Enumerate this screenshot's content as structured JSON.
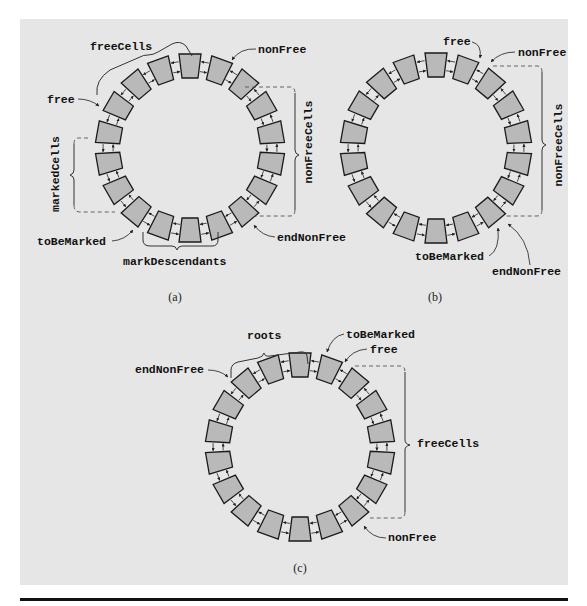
{
  "figure": {
    "colors": {
      "panel_background": "#e6e6e6",
      "cell_fill": "#b9b9b9",
      "cell_stroke": "#1a1a1a",
      "rule": "#111111"
    },
    "panel": {
      "x": 20,
      "y": 19,
      "width": 548,
      "height": 566
    },
    "bottom_rule": {
      "x": 20,
      "y": 598,
      "width": 548,
      "height": 3
    },
    "cells_per_ring": 18,
    "subfigures": [
      {
        "id": "a",
        "caption": "(a)",
        "caption_pos": [
          175,
          301
        ],
        "ring": {
          "cx": 190,
          "cy": 148,
          "r": 82
        },
        "labels": [
          {
            "text": "freeCells",
            "x": 90,
            "y": 50,
            "name": "label-freecells"
          },
          {
            "text": "nonFree",
            "x": 258,
            "y": 53,
            "name": "label-nonfree"
          },
          {
            "text": "free",
            "x": 47,
            "y": 103,
            "name": "label-free"
          },
          {
            "text": "toBeMarked",
            "x": 37,
            "y": 245,
            "name": "label-tobemarked"
          },
          {
            "text": "endNonFree",
            "x": 277,
            "y": 241,
            "name": "label-endnonfree"
          },
          {
            "text": "markDescendants",
            "x": 123,
            "y": 265,
            "name": "label-markdescendants"
          }
        ],
        "vertical_labels": [
          {
            "text": "markedCells",
            "x": 59,
            "y": 174,
            "name": "label-markedcells"
          },
          {
            "text": "nonFreeCells",
            "x": 312,
            "y": 142,
            "name": "label-nonfreecells"
          }
        ]
      },
      {
        "id": "b",
        "caption": "(b)",
        "caption_pos": [
          435,
          301
        ],
        "ring": {
          "cx": 436,
          "cy": 148,
          "r": 83
        },
        "labels": [
          {
            "text": "free",
            "x": 443,
            "y": 45,
            "name": "label-free"
          },
          {
            "text": "nonFree",
            "x": 518,
            "y": 56,
            "name": "label-nonfree"
          },
          {
            "text": "toBeMarked",
            "x": 415,
            "y": 260,
            "name": "label-tobemarked"
          },
          {
            "text": "endNonFree",
            "x": 492,
            "y": 275,
            "name": "label-endnonfree"
          }
        ],
        "vertical_labels": [
          {
            "text": "nonFreeCells",
            "x": 562,
            "y": 145,
            "name": "label-nonfreecells"
          }
        ]
      },
      {
        "id": "c",
        "caption": "(c)",
        "caption_pos": [
          300,
          572
        ],
        "ring": {
          "cx": 300,
          "cy": 447,
          "r": 82
        },
        "labels": [
          {
            "text": "roots",
            "x": 247,
            "y": 339,
            "name": "label-roots"
          },
          {
            "text": "toBeMarked",
            "x": 346,
            "y": 338,
            "name": "label-tobemarked"
          },
          {
            "text": "free",
            "x": 370,
            "y": 353,
            "name": "label-free"
          },
          {
            "text": "endNonFree",
            "x": 135,
            "y": 373,
            "name": "label-endnonfree"
          },
          {
            "text": "freeCells",
            "x": 417,
            "y": 447,
            "name": "label-freecells"
          },
          {
            "text": "nonFree",
            "x": 388,
            "y": 541,
            "name": "label-nonfree"
          }
        ],
        "vertical_labels": []
      }
    ]
  }
}
